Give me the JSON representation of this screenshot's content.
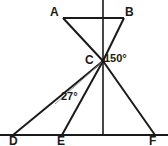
{
  "figure": {
    "type": "geometry-diagram",
    "background_color": "#ffffff",
    "stroke_color": "#1a1a1a",
    "helper_stroke_color": "#8c8c8c",
    "canvas": {
      "width": 168,
      "height": 146
    },
    "vertices": [
      {
        "id": "A",
        "label": "A",
        "x": 63,
        "y": 18
      },
      {
        "id": "B",
        "label": "B",
        "x": 124,
        "y": 18
      },
      {
        "id": "C",
        "label": "C",
        "x": 103,
        "y": 61
      },
      {
        "id": "D",
        "label": "D",
        "x": 13,
        "y": 135
      },
      {
        "id": "E",
        "label": "E",
        "x": 62,
        "y": 135
      },
      {
        "id": "F",
        "label": "F",
        "x": 155,
        "y": 135
      }
    ],
    "segments": [
      {
        "name": "segment-AB",
        "from": "A",
        "to": "B"
      },
      {
        "name": "segment-A-to-C",
        "from": "A",
        "to": "C"
      },
      {
        "name": "segment-B-to-C",
        "from": "B",
        "to": "C"
      },
      {
        "name": "segment-C-to-D",
        "from": "C",
        "to": "D"
      },
      {
        "name": "segment-C-to-E",
        "from": "C",
        "to": "E"
      },
      {
        "name": "segment-C-to-F",
        "from": "C",
        "to": "F"
      },
      {
        "name": "baseline-DF",
        "from": "D",
        "to": "F"
      },
      {
        "name": "vertical-axis",
        "from": "top",
        "to": "baseline"
      }
    ],
    "angles": [
      {
        "name": "angle-at-C",
        "value": "150°",
        "at_vertex": "C"
      },
      {
        "name": "angle-at-D",
        "value": "27°",
        "at_vertex": "D"
      }
    ]
  },
  "labels": {
    "A": "A",
    "B": "B",
    "C": "C",
    "D": "D",
    "E": "E",
    "F": "F",
    "angle_150": "150°",
    "angle_27": "27°"
  }
}
